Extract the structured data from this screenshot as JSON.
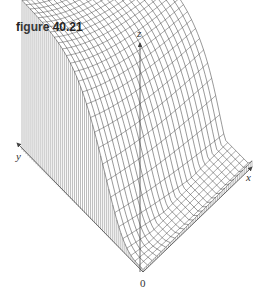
{
  "figure": {
    "title": "figure 40.21",
    "axes": {
      "x_label": "x",
      "y_label": "y",
      "z_label": "z",
      "origin_label": "0"
    }
  }
}
